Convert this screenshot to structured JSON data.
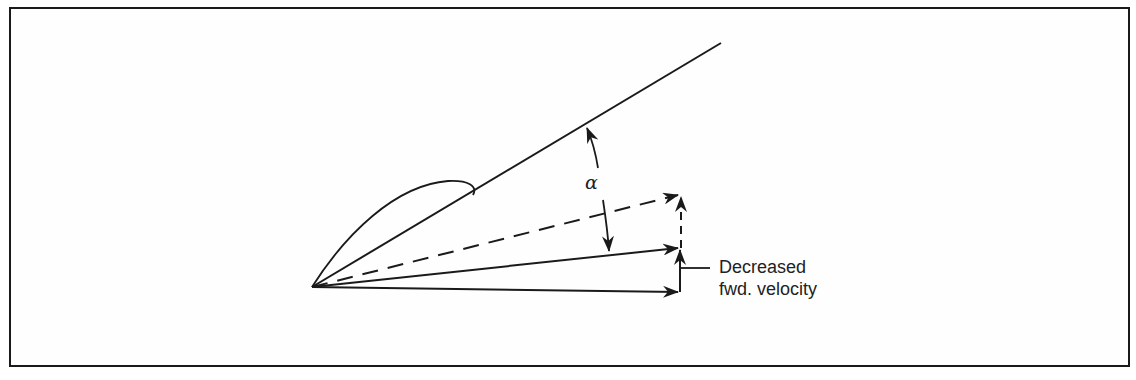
{
  "diagram": {
    "type": "airfoil velocity vector diagram",
    "angle_label": "α",
    "callout": {
      "line1": "Decreased",
      "line2": "fwd. velocity"
    },
    "colors": {
      "stroke": "#1a1a1a",
      "background": "#ffffff"
    },
    "elements": [
      {
        "name": "chord-line",
        "style": "solid"
      },
      {
        "name": "airfoil-outline",
        "style": "solid"
      },
      {
        "name": "original-relative-wind-arrow",
        "style": "dashed"
      },
      {
        "name": "new-relative-wind-arrow",
        "style": "solid"
      },
      {
        "name": "forward-velocity-arrow",
        "style": "solid"
      },
      {
        "name": "original-vertical-component-arrow",
        "style": "dashed"
      },
      {
        "name": "vertical-component-arrow",
        "style": "solid"
      },
      {
        "name": "angle-of-attack-arc",
        "style": "solid"
      }
    ]
  }
}
